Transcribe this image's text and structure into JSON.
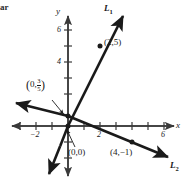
{
  "corner_text": "ar",
  "axes": {
    "x_label": "x",
    "y_label": "y",
    "x_ticks": [
      {
        "value": -2,
        "label": "−2",
        "px": 36
      },
      {
        "value": 2,
        "label": "2",
        "px": 100
      },
      {
        "value": 6,
        "label": "6",
        "px": 164
      }
    ],
    "y_ticks": [
      {
        "value": 6,
        "label": "6",
        "px": 30
      },
      {
        "value": 4,
        "label": "4",
        "px": 62
      }
    ],
    "origin_px": {
      "x": 68,
      "y": 126
    },
    "unit_px": 16,
    "x_range": [
      -3.6,
      6.6
    ],
    "y_range": [
      -3.1,
      7.0
    ]
  },
  "lines": [
    {
      "name": "L1",
      "label": "L",
      "subscript": "1",
      "slope": 2.5,
      "intercept": 0,
      "through": [
        [
          0,
          0
        ],
        [
          2,
          5
        ]
      ]
    },
    {
      "name": "L2",
      "label": "L",
      "subscript": "2",
      "slope": -0.4,
      "intercept": 0.6,
      "through": [
        [
          0,
          0.6
        ],
        [
          4,
          -1
        ]
      ]
    }
  ],
  "points": [
    {
      "id": "p-2-5",
      "label": "(2,5)",
      "coords": [
        2,
        5
      ]
    },
    {
      "id": "p-0-0",
      "label": "(0,0)",
      "coords": [
        0,
        0
      ]
    },
    {
      "id": "p-4-neg1",
      "label": "(4,−1)",
      "coords": [
        4,
        -1
      ]
    },
    {
      "id": "p-0-three-fifths",
      "label_open": "(",
      "label_x": "0,",
      "numerator": "3",
      "denominator": "5",
      "label_close": ")",
      "coords": [
        0,
        0.6
      ]
    }
  ],
  "colors": {
    "ink": "#1a1a1a",
    "axis": "#4a4a4a",
    "background": "#ffffff"
  }
}
